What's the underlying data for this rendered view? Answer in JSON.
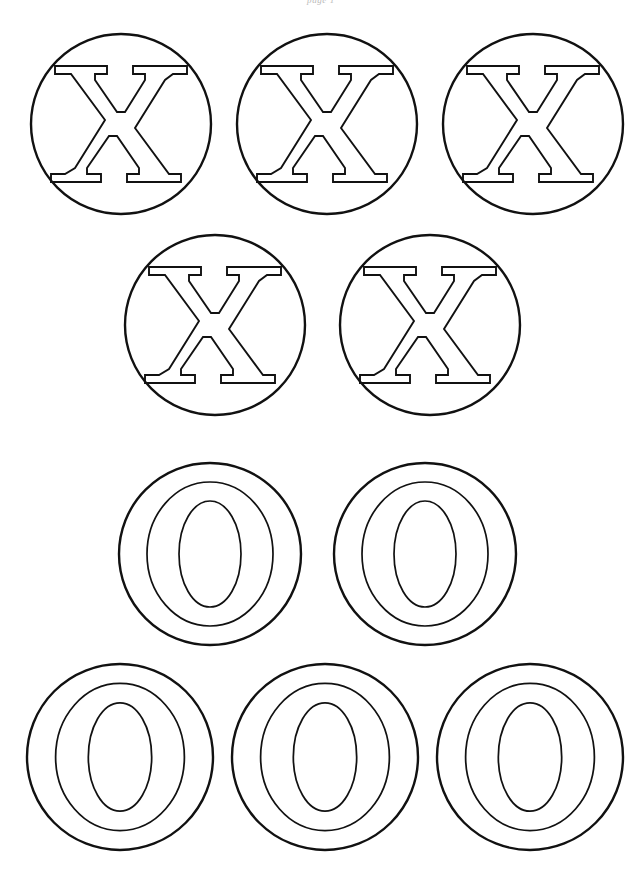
{
  "page": {
    "header_text": "page 1",
    "width": 642,
    "height": 882,
    "background_color": "#ffffff",
    "ink_color": "#111111"
  },
  "legend": {
    "x_symbol": "X",
    "o_symbol": "O",
    "x_token_name": "x-token",
    "o_token_name": "o-token"
  },
  "rows": [
    {
      "row_label": "row-1",
      "symbol": "X",
      "count": 3,
      "tokens": [
        {
          "symbol": "X",
          "cx": 121,
          "cy": 124,
          "r": 90
        },
        {
          "symbol": "X",
          "cx": 327,
          "cy": 124,
          "r": 90
        },
        {
          "symbol": "X",
          "cx": 533,
          "cy": 124,
          "r": 90
        }
      ]
    },
    {
      "row_label": "row-2",
      "symbol": "X",
      "count": 2,
      "tokens": [
        {
          "symbol": "X",
          "cx": 215,
          "cy": 325,
          "r": 90
        },
        {
          "symbol": "X",
          "cx": 430,
          "cy": 325,
          "r": 90
        }
      ]
    },
    {
      "row_label": "row-3",
      "symbol": "O",
      "count": 2,
      "tokens": [
        {
          "symbol": "O",
          "cx": 210,
          "cy": 554,
          "r": 91
        },
        {
          "symbol": "O",
          "cx": 425,
          "cy": 554,
          "r": 91
        }
      ]
    },
    {
      "row_label": "row-4",
      "symbol": "O",
      "count": 3,
      "tokens": [
        {
          "symbol": "O",
          "cx": 120,
          "cy": 757,
          "r": 93
        },
        {
          "symbol": "O",
          "cx": 325,
          "cy": 757,
          "r": 93
        },
        {
          "symbol": "O",
          "cx": 530,
          "cy": 757,
          "r": 93
        }
      ]
    }
  ],
  "totals": {
    "x_count": 5,
    "o_count": 5,
    "token_count": 10
  }
}
